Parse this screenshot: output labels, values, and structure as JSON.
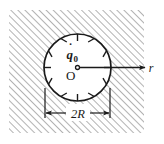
{
  "figure": {
    "type": "engineering-cross-section-diagram",
    "title": "",
    "labels": {
      "heat_generation": "q",
      "heat_generation_dot": "·",
      "heat_generation_sub": "0",
      "origin": "O",
      "radial_axis": "r",
      "diameter": "2R"
    },
    "colors": {
      "line": "#1a1a1a",
      "hatch": "#9a9a9a",
      "background": "#ffffff",
      "disk_fill": "#ffffff"
    },
    "geometry": {
      "hatch_region": {
        "x": 9,
        "y": 10,
        "width": 135,
        "height": 123
      },
      "hatch_angle_deg": 45,
      "hatch_spacing_px": 5,
      "circle": {
        "cx": 77.5,
        "cy": 67.5,
        "r": 33.5
      },
      "center_dot_r": 2,
      "tick_count": 12,
      "tick_length": 7,
      "radial_arrow": {
        "x1": 77.5,
        "y1": 67.5,
        "x2": 145,
        "y2": 67.5
      },
      "dimension_line": {
        "y": 113,
        "x1": 45,
        "x2": 110
      },
      "extension_lines": {
        "x_left": 45,
        "x_right": 110,
        "y_top": 88,
        "y_bottom": 118
      }
    }
  }
}
